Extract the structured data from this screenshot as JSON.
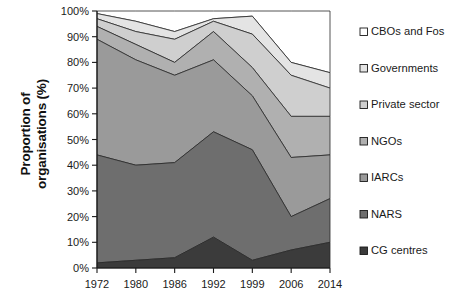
{
  "chart": {
    "ylabel_line1": "Proportion of",
    "ylabel_line2": "organisations (%)"
  },
  "axis": {
    "y_ticks": [
      "0%",
      "10%",
      "20%",
      "30%",
      "40%",
      "50%",
      "60%",
      "70%",
      "80%",
      "90%",
      "100%"
    ],
    "x_ticks": [
      "1972",
      "1980",
      "1986",
      "1992",
      "1999",
      "2006",
      "2014"
    ]
  },
  "legend": {
    "items": [
      {
        "label": "CBOs and Fos",
        "color": "#ffffff"
      },
      {
        "label": "Governments",
        "color": "#e4e4e4"
      },
      {
        "label": "Private sector",
        "color": "#cfcfcf"
      },
      {
        "label": "NGOs",
        "color": "#b0b0b0"
      },
      {
        "label": "IARCs",
        "color": "#9a9a9a"
      },
      {
        "label": "NARS",
        "color": "#6e6e6e"
      },
      {
        "label": "CG centres",
        "color": "#3b3b3b"
      }
    ]
  },
  "chart_data": {
    "type": "area",
    "title": "",
    "xlabel": "",
    "ylabel": "Proportion of organisations (%)",
    "ylim": [
      0,
      100
    ],
    "grid": false,
    "legend_position": "right",
    "stacked": true,
    "x": [
      "1972",
      "1980",
      "1986",
      "1992",
      "1999",
      "2006",
      "2014"
    ],
    "series": [
      {
        "name": "CG centres",
        "color": "#3b3b3b",
        "values": [
          2,
          3,
          4,
          12,
          3,
          7,
          10
        ]
      },
      {
        "name": "NARS",
        "color": "#6e6e6e",
        "values": [
          42,
          37,
          37,
          41,
          43,
          13,
          17
        ]
      },
      {
        "name": "IARCs",
        "color": "#9a9a9a",
        "values": [
          45,
          41,
          34,
          28,
          21,
          23,
          17
        ]
      },
      {
        "name": "NGOs",
        "color": "#b0b0b0",
        "values": [
          5,
          6,
          5,
          11,
          11,
          16,
          15
        ]
      },
      {
        "name": "Private sector",
        "color": "#cfcfcf",
        "values": [
          3,
          5,
          9,
          4,
          13,
          16,
          11
        ]
      },
      {
        "name": "Governments",
        "color": "#e4e4e4",
        "values": [
          2,
          4,
          3,
          1,
          7,
          5,
          6
        ]
      },
      {
        "name": "CBOs and Fos",
        "color": "#ffffff",
        "values": [
          1,
          4,
          8,
          3,
          2,
          20,
          24
        ]
      }
    ],
    "cumulative_tops": {
      "CG centres": [
        2,
        3,
        4,
        12,
        3,
        7,
        10
      ],
      "NARS": [
        44,
        40,
        41,
        53,
        46,
        20,
        27
      ],
      "IARCs": [
        89,
        81,
        75,
        81,
        67,
        43,
        44
      ],
      "NGOs": [
        94,
        87,
        80,
        92,
        78,
        59,
        59
      ],
      "Private sector": [
        97,
        92,
        89,
        96,
        91,
        75,
        70
      ],
      "Governments": [
        99,
        96,
        92,
        97,
        98,
        80,
        76
      ],
      "CBOs and Fos": [
        100,
        100,
        100,
        100,
        100,
        100,
        100
      ]
    }
  }
}
